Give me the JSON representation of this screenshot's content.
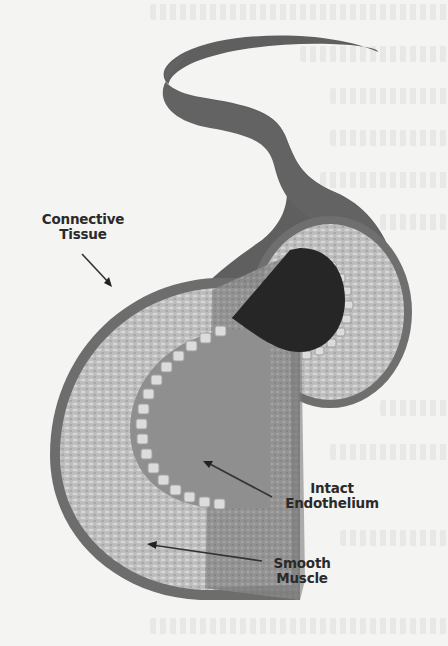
{
  "figure": {
    "type": "artery cross-section illustration",
    "labels": [
      {
        "id": "connective",
        "text_line1": "Connective",
        "text_line2": "Tissue"
      },
      {
        "id": "endothelium",
        "text_line1": "Intact",
        "text_line2": "Endothelium"
      },
      {
        "id": "muscle",
        "text_line1": "Smooth",
        "text_line2": "Muscle"
      }
    ],
    "colors": {
      "page_background": "#f4f4f2",
      "connective_tissue": "#5c5c5c",
      "outer_ring": "#7a7a7a",
      "smooth_muscle": "#bdbdbd",
      "cut_face": "#8d8d8d",
      "endothelium_cells": "#d8d8d8",
      "lumen": "#262626",
      "label_text": "#2a2a2a"
    }
  }
}
